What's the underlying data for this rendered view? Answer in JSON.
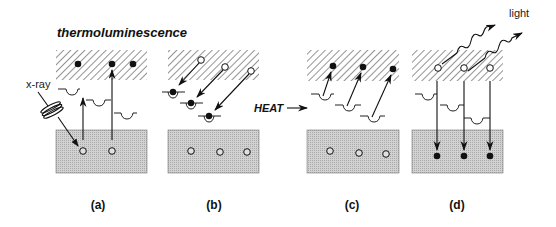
{
  "title": "thermoluminescence",
  "labels": {
    "xray": "x-ray",
    "heat": "HEAT",
    "light": "light"
  },
  "panels": [
    {
      "id": "a",
      "label": "(a)",
      "band_x": 56,
      "band_w": 91,
      "label_x": 98,
      "conduction_electrons": [
        [
          77,
          64
        ],
        [
          107,
          64
        ],
        [
          127,
          64
        ]
      ],
      "valence_holes": [
        [
          84,
          151
        ],
        [
          113,
          151
        ]
      ],
      "traps": [
        [
          58,
          89
        ],
        [
          88,
          100
        ],
        [
          113,
          114
        ]
      ],
      "description": "x-ray excites electrons from valence band to conduction band"
    },
    {
      "id": "b",
      "label": "(b)",
      "band_x": 168,
      "band_w": 91,
      "label_x": 214,
      "conduction_holes": [
        [
          200,
          60
        ],
        [
          225,
          67
        ],
        [
          251,
          71
        ]
      ],
      "trapped_electrons": [
        [
          172,
          92
        ],
        [
          190,
          103
        ],
        [
          208,
          115
        ]
      ],
      "valence_holes": [
        [
          191,
          151
        ],
        [
          219,
          151
        ],
        [
          247,
          151
        ]
      ],
      "description": "electrons fall into traps"
    },
    {
      "id": "c",
      "label": "(c)",
      "band_x": 307,
      "band_w": 92,
      "label_x": 352,
      "conduction_electrons": [
        [
          333,
          66
        ],
        [
          363,
          67
        ],
        [
          392,
          69
        ]
      ],
      "traps": [
        [
          311,
          95
        ],
        [
          336,
          106
        ],
        [
          360,
          117
        ]
      ],
      "valence_holes": [
        [
          330,
          151
        ],
        [
          359,
          153
        ],
        [
          386,
          154
        ]
      ],
      "description": "heat releases trapped electrons to conduction band"
    },
    {
      "id": "d",
      "label": "(d)",
      "band_x": 412,
      "band_w": 91,
      "label_x": 457,
      "conduction_holes": [
        [
          438,
          68
        ],
        [
          464,
          68
        ],
        [
          490,
          68
        ]
      ],
      "traps": [
        [
          415,
          95
        ],
        [
          440,
          106
        ],
        [
          466,
          118
        ]
      ],
      "valence_electrons": [
        [
          437,
          156
        ],
        [
          464,
          156
        ],
        [
          490,
          156
        ]
      ],
      "description": "electrons recombine with holes emitting light"
    }
  ],
  "colors": {
    "hatch": "#333333",
    "valence_fill": "#c9c9c9",
    "ink": "#111111"
  }
}
